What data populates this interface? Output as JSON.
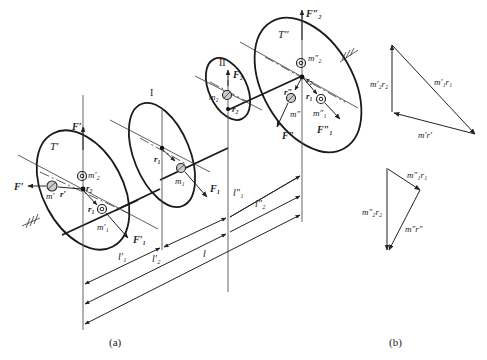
{
  "figure": {
    "caption_a": "(a)",
    "caption_b": "(b)",
    "plane_labels": {
      "plane_1": "I",
      "plane_2": "II"
    },
    "disc_labels": {
      "left_disc": "T′",
      "right_disc": "T″"
    },
    "left_disc": {
      "forces": {
        "vertical": "F′₂",
        "horizontal": "F′",
        "diagonal": "F′₁"
      },
      "masses": {
        "m2": "m′₂",
        "m": "m′",
        "m1": "m′₁"
      },
      "radii": {
        "r2": "r₂",
        "r": "r′",
        "r1": "r₁"
      }
    },
    "middle_disc_1": {
      "force": "F₁",
      "mass": "m₁",
      "radius": "r₁"
    },
    "middle_disc_2": {
      "force": "F₂",
      "mass": "m₂",
      "radius": "r₂"
    },
    "right_disc": {
      "forces": {
        "vertical": "F″₂",
        "diagonal_left": "F″",
        "diagonal_right": "F″₁"
      },
      "masses": {
        "m2": "m″₂",
        "m": "m″",
        "m1": "m″₁"
      },
      "radii": {
        "r2": "r₂",
        "r": "r″",
        "r1": "r₁"
      }
    },
    "dimensions": {
      "l1_prime": "l′₁",
      "l2_prime": "l′₂",
      "l1_double": "l″₁",
      "l2_double": "l″₂",
      "l": "l"
    },
    "vector_polygon_top": {
      "sides": [
        "m′₂r₂",
        "m′₁r₁",
        "m′r′"
      ]
    },
    "vector_polygon_bottom": {
      "sides": [
        "m″₂r₂",
        "m″₁r₁",
        "m″r″"
      ]
    }
  }
}
